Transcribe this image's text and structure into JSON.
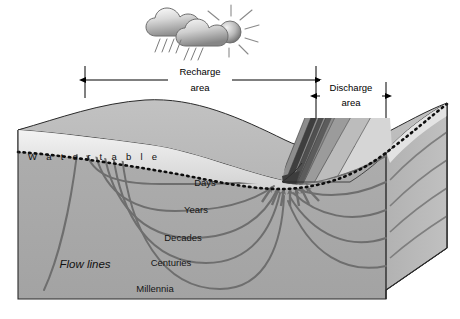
{
  "figure": {
    "background_color": "#ffffff"
  },
  "weather": {
    "cloud_icon": "cloud-icon",
    "sun_icon": "sun-icon",
    "rain_icon": "rain-streaks-icon",
    "ray_icon": "sun-rays-icon"
  },
  "dimensions": [
    {
      "id": "recharge",
      "label_line1": "Recharge",
      "label_line2": "area",
      "x_start": 85,
      "x_end": 316,
      "y": 80,
      "label_x": 200,
      "label_y1": 72,
      "label_y2": 88
    },
    {
      "id": "discharge",
      "label_line1": "Discharge",
      "label_line2": "area",
      "x_start": 316,
      "x_end": 386,
      "y": 96,
      "label_x": 351,
      "label_y1": 88,
      "label_y2": 103
    }
  ],
  "water_table": {
    "label": "W a t e r   t a b l e",
    "label_x": 28,
    "label_y": 157,
    "line_style": "dotted",
    "color": "#0d0d0d"
  },
  "flow_lines": {
    "label": "Flow lines",
    "label_x": 85,
    "label_y": 265,
    "color": "#6e6e6e"
  },
  "time_labels": [
    {
      "text": "Days",
      "x": 205,
      "y": 183
    },
    {
      "text": "Years",
      "x": 196,
      "y": 210
    },
    {
      "text": "Decades",
      "x": 183,
      "y": 238
    },
    {
      "text": "Centuries",
      "x": 171,
      "y": 263
    },
    {
      "text": "Millennia",
      "x": 155,
      "y": 289
    }
  ],
  "colors": {
    "top_surface": "#b3b3b3",
    "unsaturated_zone": "#e6e6e6",
    "saturated_zone": "#aaaaaa",
    "left_face": "#bdbdbd",
    "right_face": "#b5b5b5",
    "flow_line": "#6e6e6e",
    "strata_dark": "#4a4a4a",
    "strata_mid": "#7a7a7a",
    "strata_light": "#cfcfcf",
    "outline": "#2a2a2a",
    "text": "#111111"
  }
}
